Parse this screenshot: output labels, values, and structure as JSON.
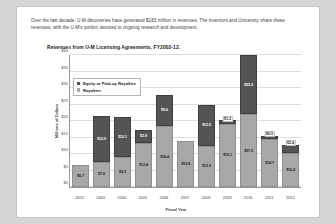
{
  "document": {
    "intro_paragraph": "Over the last decade, U-M discoveries have generated $183 million in revenues. The inventors and University share these revenues, with the U-M's portion devoted to ongoing research and development."
  },
  "chart_data": {
    "type": "bar",
    "subtype": "stacked-bar",
    "title": "Revenues from U-M Licensing Agreements, FY2002-12.",
    "xlabel": "Fiscal Year",
    "ylabel": "Millions of Dollars",
    "ylim": [
      0,
      40
    ],
    "yticks": [
      "$0",
      "$5",
      "$10",
      "$15",
      "$20",
      "$25",
      "$30",
      "$35",
      "$40"
    ],
    "ytick_values": [
      0,
      5,
      10,
      15,
      20,
      25,
      30,
      35,
      40
    ],
    "grid": true,
    "legend_position": "top-left",
    "categories": [
      "2002",
      "2003",
      "2004",
      "2005",
      "2006",
      "2007",
      "2008",
      "2009",
      "2010",
      "2011",
      "2012"
    ],
    "series": [
      {
        "name": "Royalties",
        "color": "#a8a8a8",
        "values": [
          6.7,
          7.6,
          9.2,
          13.4,
          18.4,
          13.8,
          12.5,
          19.1,
          27.5,
          14.7,
          10.4
        ],
        "labels": [
          "$6.7",
          "$7.6",
          "$9.2",
          "$13.4",
          "$18.4",
          "$13.8",
          "$12.5",
          "$19.1",
          "$27.5",
          "$14.7",
          "$10.4"
        ]
      },
      {
        "name": "Equity or Paid-up Royalties",
        "color": "#545454",
        "values": [
          0,
          13.9,
          12.1,
          3.9,
          9.6,
          0,
          12.5,
          1.2,
          22.3,
          0.9,
          2.4
        ],
        "labels": [
          "",
          "$13.9",
          "$12.1",
          "$3.9",
          "$9.6",
          "",
          "$12.5",
          "$1.2",
          "$22.3",
          "$0.9",
          "$2.4"
        ]
      }
    ],
    "legend": [
      {
        "label": "Equity or Paid-up Royalties",
        "color": "#545454"
      },
      {
        "label": "Royalties",
        "color": "#a8a8a8"
      }
    ]
  }
}
